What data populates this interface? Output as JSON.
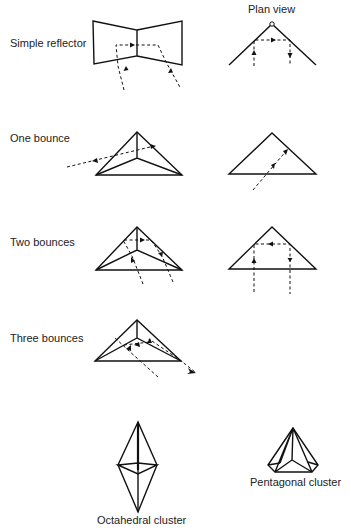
{
  "labels": {
    "simple_reflector": "Simple reflector",
    "plan_view": "Plan view",
    "one_bounce": "One bounce",
    "two_bounces": "Two bounces",
    "three_bounces": "Three bounces",
    "octahedral_cluster": "Octahedral cluster",
    "pentagonal_cluster": "Pentagonal cluster"
  },
  "colors": {
    "line": "#111111",
    "background": "#ffffff",
    "text": "#222222"
  }
}
